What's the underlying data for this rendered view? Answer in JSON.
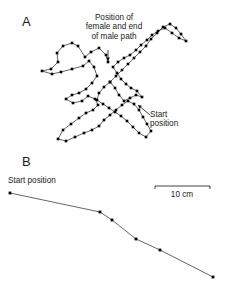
{
  "figure": {
    "background_color": "#ffffff",
    "ink_color": "#111111",
    "marker_color": "#000000",
    "width": 234,
    "height": 288
  },
  "panels": [
    {
      "id": "A",
      "letter": "A",
      "letter_pos": [
        22,
        26
      ],
      "description": "Tortuous male search path with dense central cluster"
    },
    {
      "id": "B",
      "letter": "B",
      "letter_pos": [
        22,
        166
      ],
      "description": "Near straight path descending to the right"
    }
  ],
  "annotations": [
    {
      "name": "position-of-female-label",
      "lines": [
        "Position of",
        "female and end",
        "of male path"
      ],
      "x": 114,
      "y": 20,
      "line_height": 9.4,
      "anchor": "middle",
      "leader": {
        "type": "arrow-down",
        "x1": 108,
        "y1": 50,
        "x2": 108,
        "y2": 61
      }
    },
    {
      "name": "start-position-label-a",
      "lines": [
        "Start",
        "position"
      ],
      "x": 150,
      "y": 117,
      "line_height": 9.4,
      "anchor": "start",
      "leader": {
        "type": "arrow-up-left",
        "x1": 150,
        "y1": 115,
        "x2": 138,
        "y2": 105
      }
    },
    {
      "name": "start-position-label-b",
      "lines": [
        "Start position"
      ],
      "x": 8,
      "y": 183,
      "line_height": 9.4,
      "anchor": "start",
      "leader": null
    }
  ],
  "scale_bar": {
    "name": "scale-bar",
    "label": "10 cm",
    "value": 10,
    "unit": "cm",
    "x1": 155,
    "x2": 210,
    "y": 186,
    "tick_height": 3,
    "label_x": 182,
    "label_y": 197
  },
  "chart_data": {
    "type": "line",
    "xlabel": "",
    "ylabel": "",
    "units": "cm",
    "scale_reference": {
      "pixels": 55,
      "value": 10,
      "unit": "cm"
    },
    "grid": false,
    "legend": "none",
    "series": [
      {
        "name": "panel-a-male-path",
        "panel": "A",
        "marker": "square",
        "points": [
          [
            108,
            62
          ],
          [
            106,
            55
          ],
          [
            99,
            48
          ],
          [
            91,
            52
          ],
          [
            85,
            57
          ],
          [
            78,
            46
          ],
          [
            72,
            43
          ],
          [
            63,
            46
          ],
          [
            57,
            53
          ],
          [
            58,
            62
          ],
          [
            51,
            69
          ],
          [
            42,
            71
          ],
          [
            52,
            74
          ],
          [
            61,
            72
          ],
          [
            72,
            69
          ],
          [
            83,
            66
          ],
          [
            89,
            61
          ],
          [
            94,
            67
          ],
          [
            97,
            76
          ],
          [
            92,
            83
          ],
          [
            86,
            89
          ],
          [
            79,
            93
          ],
          [
            72,
            95
          ],
          [
            66,
            99
          ],
          [
            73,
            103
          ],
          [
            82,
            101
          ],
          [
            88,
            96
          ],
          [
            95,
            99
          ],
          [
            98,
            105
          ],
          [
            93,
            110
          ],
          [
            86,
            113
          ],
          [
            79,
            118
          ],
          [
            71,
            124
          ],
          [
            63,
            130
          ],
          [
            58,
            139
          ],
          [
            66,
            141
          ],
          [
            75,
            137
          ],
          [
            84,
            133
          ],
          [
            92,
            130
          ],
          [
            99,
            126
          ],
          [
            104,
            120
          ],
          [
            110,
            115
          ],
          [
            116,
            110
          ],
          [
            122,
            105
          ],
          [
            128,
            101
          ],
          [
            134,
            104
          ],
          [
            139,
            110
          ],
          [
            143,
            117
          ],
          [
            147,
            124
          ],
          [
            151,
            131
          ],
          [
            146,
            137
          ],
          [
            139,
            133
          ],
          [
            133,
            127
          ],
          [
            127,
            121
          ],
          [
            121,
            116
          ],
          [
            115,
            112
          ],
          [
            109,
            108
          ],
          [
            103,
            104
          ],
          [
            97,
            100
          ],
          [
            99,
            93
          ],
          [
            104,
            87
          ],
          [
            110,
            82
          ],
          [
            115,
            88
          ],
          [
            119,
            95
          ],
          [
            124,
            101
          ],
          [
            130,
            98
          ],
          [
            136,
            95
          ],
          [
            142,
            97
          ],
          [
            137,
            91
          ],
          [
            131,
            88
          ],
          [
            126,
            84
          ],
          [
            121,
            79
          ],
          [
            117,
            73
          ],
          [
            113,
            67
          ],
          [
            118,
            62
          ],
          [
            124,
            58
          ],
          [
            130,
            55
          ],
          [
            136,
            50
          ],
          [
            141,
            45
          ],
          [
            147,
            40
          ],
          [
            152,
            35
          ],
          [
            158,
            31
          ],
          [
            165,
            28
          ],
          [
            172,
            33
          ],
          [
            179,
            38
          ],
          [
            186,
            41
          ],
          [
            181,
            34
          ],
          [
            176,
            28
          ],
          [
            170,
            24
          ],
          [
            163,
            27
          ],
          [
            157,
            33
          ],
          [
            151,
            39
          ],
          [
            146,
            46
          ],
          [
            140,
            52
          ],
          [
            134,
            58
          ],
          [
            128,
            64
          ],
          [
            122,
            70
          ],
          [
            116,
            76
          ],
          [
            110,
            82
          ]
        ]
      },
      {
        "name": "panel-b-control-path",
        "panel": "B",
        "marker": "square",
        "points": [
          [
            10,
            193
          ],
          [
            100,
            212
          ],
          [
            112,
            220
          ],
          [
            136,
            239
          ],
          [
            160,
            250
          ],
          [
            213,
            277
          ]
        ]
      }
    ]
  }
}
